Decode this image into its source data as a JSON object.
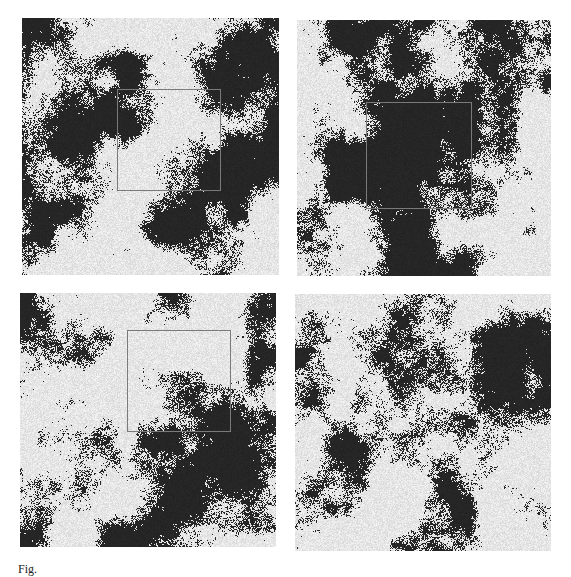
{
  "figure": {
    "colors": {
      "cluster": "#e6e6e6",
      "background": "#262626",
      "inset_border": "#7a7a7a",
      "page": "#ffffff"
    },
    "panels": [
      {
        "id": "top-left",
        "x": 22,
        "y": 18,
        "w": 257,
        "h": 257,
        "seed": 11,
        "density": 0.62,
        "inset": {
          "x": 117,
          "y": 89,
          "w": 104,
          "h": 102
        }
      },
      {
        "id": "top-right",
        "x": 297,
        "y": 20,
        "w": 254,
        "h": 256,
        "seed": 23,
        "density": 0.6,
        "inset": {
          "x": 366,
          "y": 102,
          "w": 106,
          "h": 107
        }
      },
      {
        "id": "bottom-left",
        "x": 20,
        "y": 293,
        "w": 256,
        "h": 254,
        "seed": 37,
        "density": 0.6,
        "inset": {
          "x": 127,
          "y": 330,
          "w": 104,
          "h": 102
        }
      },
      {
        "id": "bottom-right",
        "x": 295,
        "y": 294,
        "w": 256,
        "h": 257,
        "seed": 53,
        "density": 0.63,
        "inset": null
      }
    ],
    "caption": "Fig."
  }
}
